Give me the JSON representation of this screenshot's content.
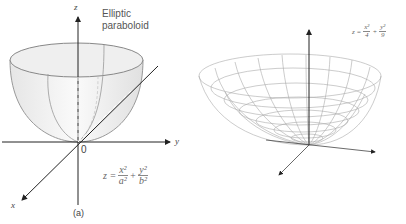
{
  "left_figure": {
    "title_line1": "Elliptic",
    "title_line2": "paraboloid",
    "axis_z": "z",
    "axis_y": "y",
    "axis_x": "x",
    "origin": "0",
    "eq_lhs": "z =",
    "eq_t1_num": "x²",
    "eq_t1_den": "a²",
    "eq_plus": "+",
    "eq_t2_num": "y²",
    "eq_t2_den": "b²",
    "caption": "(a)"
  },
  "right_figure": {
    "eq_lhs": "z =",
    "eq_t1_num": "x²",
    "eq_t1_den": "4",
    "eq_plus": "+",
    "eq_t2_num": "y²",
    "eq_t2_den": "9"
  }
}
